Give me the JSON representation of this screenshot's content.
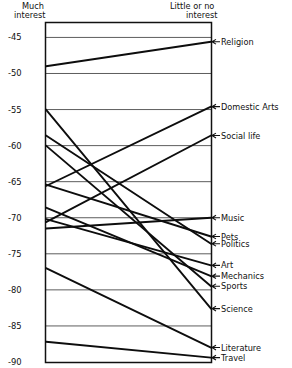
{
  "chart_data": {
    "type": "line",
    "title": "",
    "subtitle": "",
    "xlabel": "",
    "ylabel": "",
    "grid": true,
    "legend_position": "right-axis-labels",
    "axes": [
      {
        "name": "left",
        "label_line1": "Much",
        "label_line2": "interest"
      },
      {
        "name": "right",
        "label_line1": "Little or no",
        "label_line2": "interest"
      }
    ],
    "x": [
      "Much interest",
      "Little or no interest"
    ],
    "ylim": [
      -90,
      -43
    ],
    "yticks": [
      -45,
      -50,
      -55,
      -60,
      -65,
      -70,
      -75,
      -80,
      -85,
      -90
    ],
    "ytick_labels": [
      "-45",
      "-50",
      "-55",
      "-60",
      "-65",
      "-70",
      "-75",
      "-80",
      "-85",
      "-90"
    ],
    "series": [
      {
        "name": "Religion",
        "values": [
          -49.0,
          -45.6
        ]
      },
      {
        "name": "Domestic Arts",
        "values": [
          -65.6,
          -54.6
        ]
      },
      {
        "name": "Social life",
        "values": [
          -70.6,
          -58.6
        ]
      },
      {
        "name": "Music",
        "values": [
          -71.5,
          -70.0
        ]
      },
      {
        "name": "Pets",
        "values": [
          -65.4,
          -72.6
        ]
      },
      {
        "name": "Politics",
        "values": [
          -58.6,
          -73.6
        ]
      },
      {
        "name": "Art",
        "values": [
          -70.2,
          -76.6
        ]
      },
      {
        "name": "Mechanics",
        "values": [
          -68.6,
          -78.1
        ]
      },
      {
        "name": "Sports",
        "values": [
          -60.0,
          -79.5
        ]
      },
      {
        "name": "Science",
        "values": [
          -55.0,
          -82.6
        ]
      },
      {
        "name": "Literature",
        "values": [
          -77.0,
          -88.0
        ]
      },
      {
        "name": "Travel",
        "values": [
          -87.2,
          -89.4
        ]
      }
    ]
  },
  "left_axis": {
    "title_line1": "Much",
    "title_line2": "interest"
  },
  "right_axis": {
    "title_line1": "Little or no",
    "title_line2": "interest"
  },
  "ticks": [
    {
      "label": "-45"
    },
    {
      "label": "-50"
    },
    {
      "label": "-55"
    },
    {
      "label": "-60"
    },
    {
      "label": "-65"
    },
    {
      "label": "-70"
    },
    {
      "label": "-75"
    },
    {
      "label": "-80"
    },
    {
      "label": "-85"
    },
    {
      "label": "-90"
    }
  ],
  "categories": [
    {
      "label": "Religion"
    },
    {
      "label": "Domestic Arts"
    },
    {
      "label": "Social life"
    },
    {
      "label": "Music"
    },
    {
      "label": "Pets"
    },
    {
      "label": "Politics"
    },
    {
      "label": "Art"
    },
    {
      "label": "Mechanics"
    },
    {
      "label": "Sports"
    },
    {
      "label": "Science"
    },
    {
      "label": "Literature"
    },
    {
      "label": "Travel"
    }
  ]
}
